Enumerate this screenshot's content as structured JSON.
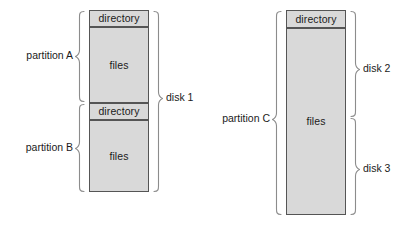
{
  "diagram": {
    "colors": {
      "block_fill": "#d9d9d9",
      "block_stroke": "#555555",
      "brace_stroke": "#8c8c8c",
      "text": "#1b1b1b",
      "background": "#ffffff"
    },
    "disk_groups": [
      {
        "id": "disk-1",
        "disk_label": "disk 1",
        "partitions": [
          {
            "id": "partition-a",
            "label": "partition A",
            "blocks": [
              {
                "id": "directory-a",
                "label": "directory",
                "kind": "directory"
              },
              {
                "id": "files-a",
                "label": "files",
                "kind": "files"
              }
            ]
          },
          {
            "id": "partition-b",
            "label": "partition B",
            "blocks": [
              {
                "id": "directory-b",
                "label": "directory",
                "kind": "directory"
              },
              {
                "id": "files-b",
                "label": "files",
                "kind": "files"
              }
            ]
          }
        ]
      },
      {
        "id": "disk-2-3",
        "disk_labels": [
          "disk 2",
          "disk 3"
        ],
        "partitions": [
          {
            "id": "partition-c",
            "label": "partition C",
            "blocks": [
              {
                "id": "directory-c",
                "label": "directory",
                "kind": "directory"
              },
              {
                "id": "files-c",
                "label": "files",
                "kind": "files"
              }
            ]
          }
        ]
      }
    ]
  },
  "labels": {
    "partition_a": "partition A",
    "partition_b": "partition B",
    "partition_c": "partition C",
    "disk_1": "disk 1",
    "disk_2": "disk 2",
    "disk_3": "disk 3",
    "directory_a": "directory",
    "files_a": "files",
    "directory_b": "directory",
    "files_b": "files",
    "directory_c": "directory",
    "files_c": "files"
  }
}
